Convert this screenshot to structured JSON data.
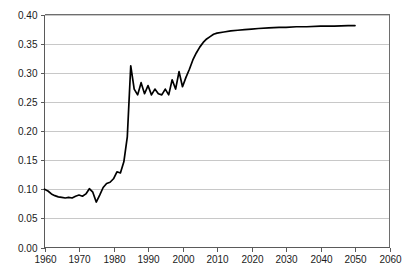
{
  "chart_data": {
    "type": "line",
    "title": "",
    "subtitle": "",
    "xlabel": "",
    "ylabel": "",
    "xlim": [
      1960,
      2060
    ],
    "ylim": [
      0.0,
      0.4
    ],
    "grid": "horizontal",
    "legend": "none",
    "line_color": "#000000",
    "gridline_color": "#c8c8c8",
    "frame_color": "#6e6e6e",
    "y_ticks": [
      "0.00",
      "0.05",
      "0.10",
      "0.15",
      "0.20",
      "0.25",
      "0.30",
      "0.35",
      "0.40"
    ],
    "y_tick_values": [
      0.0,
      0.05,
      0.1,
      0.15,
      0.2,
      0.25,
      0.3,
      0.35,
      0.4
    ],
    "x_ticks": [
      "1960",
      "1970",
      "1980",
      "1990",
      "2000",
      "2010",
      "2020",
      "2030",
      "2040",
      "2050",
      "2060"
    ],
    "x_tick_values": [
      1960,
      1970,
      1980,
      1990,
      2000,
      2010,
      2020,
      2030,
      2040,
      2050,
      2060
    ],
    "series": [
      {
        "name": "series-1",
        "x": [
          1960,
          1961,
          1962,
          1963,
          1964,
          1965,
          1966,
          1967,
          1968,
          1969,
          1970,
          1971,
          1972,
          1973,
          1974,
          1975,
          1976,
          1977,
          1978,
          1979,
          1980,
          1981,
          1982,
          1983,
          1984,
          1985,
          1986,
          1987,
          1988,
          1989,
          1990,
          1991,
          1992,
          1993,
          1994,
          1995,
          1996,
          1997,
          1998,
          1999,
          2000,
          2001,
          2002,
          2003,
          2004,
          2005,
          2006,
          2007,
          2008,
          2009,
          2010,
          2012,
          2014,
          2016,
          2018,
          2020,
          2022,
          2025,
          2028,
          2030,
          2033,
          2036,
          2040,
          2044,
          2048,
          2050
        ],
        "values": [
          0.1,
          0.097,
          0.092,
          0.089,
          0.087,
          0.086,
          0.085,
          0.086,
          0.085,
          0.088,
          0.09,
          0.088,
          0.092,
          0.101,
          0.095,
          0.078,
          0.09,
          0.103,
          0.11,
          0.112,
          0.118,
          0.13,
          0.128,
          0.147,
          0.19,
          0.312,
          0.272,
          0.262,
          0.283,
          0.264,
          0.278,
          0.262,
          0.272,
          0.264,
          0.262,
          0.272,
          0.262,
          0.288,
          0.272,
          0.302,
          0.276,
          0.292,
          0.306,
          0.322,
          0.334,
          0.344,
          0.352,
          0.358,
          0.362,
          0.366,
          0.368,
          0.37,
          0.372,
          0.373,
          0.374,
          0.375,
          0.376,
          0.377,
          0.378,
          0.378,
          0.379,
          0.379,
          0.38,
          0.38,
          0.381,
          0.381
        ]
      }
    ]
  }
}
